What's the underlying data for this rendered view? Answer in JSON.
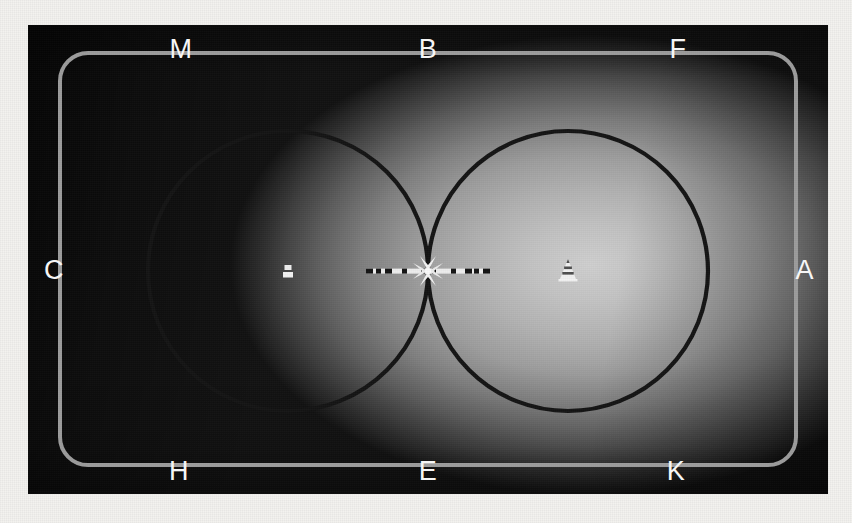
{
  "figure": {
    "canvas": {
      "width": 852,
      "height": 523,
      "background_color": "#f3f2ef"
    },
    "plate": {
      "x": 28,
      "y": 25,
      "width": 800,
      "height": 469,
      "dark_color": "#121212",
      "highlight_color": "#cfcfcf",
      "highlight_center": "562,240"
    },
    "rounded_rect": {
      "x": 32,
      "y": 28,
      "width": 736,
      "height": 412,
      "corner_radius": 28,
      "stroke_color": "#9c9c9c",
      "stroke_width": 4
    },
    "circles": [
      {
        "name": "left-circle",
        "cx": 260,
        "cy": 246,
        "r": 140,
        "stroke_color": "#141414",
        "stroke_width": 4
      },
      {
        "name": "right-circle",
        "cx": 540,
        "cy": 246,
        "r": 140,
        "stroke_color": "#141414",
        "stroke_width": 4
      }
    ],
    "tangent_point": {
      "x": 400,
      "y": 246,
      "marker": "star-burst",
      "color": "#f5f5f5"
    },
    "scale_bar": {
      "name": "horizontal-ruler",
      "x1": 338,
      "x2": 462,
      "y": 246,
      "body_color": "#f2f2f2",
      "tick_color": "#161616",
      "thickness": 5
    },
    "markers": [
      {
        "name": "pedestal-marker",
        "x": 260,
        "y": 248,
        "shape": "stacked-blocks",
        "color": "#f0f0f0"
      },
      {
        "name": "cone-marker",
        "x": 540,
        "y": 248,
        "shape": "striped-cone",
        "color": "#f0f0f0"
      }
    ],
    "labels": {
      "top": [
        {
          "id": "M",
          "text": "M"
        },
        {
          "id": "B",
          "text": "B"
        },
        {
          "id": "F",
          "text": "F"
        }
      ],
      "bottom": [
        {
          "id": "H",
          "text": "H"
        },
        {
          "id": "E",
          "text": "E"
        },
        {
          "id": "K",
          "text": "K"
        }
      ],
      "left": {
        "id": "C",
        "text": "C"
      },
      "right": {
        "id": "A",
        "text": "A"
      },
      "color": "#f6f6f6"
    }
  }
}
